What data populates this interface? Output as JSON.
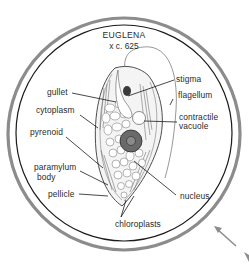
{
  "figure": {
    "title": "EUGLENA",
    "magnification": "x c. 625",
    "colors": {
      "outer_ring": "#8c8c8c",
      "inner_ring": "#1a1a1a",
      "ink": "#2a2a2a",
      "arrow": "#8c8c8c"
    },
    "labels": {
      "gullet": "gullet",
      "cytoplasm": "cytoplasm",
      "pyrenoid": "pyrenoid",
      "paramylum_body_line1": "paramylum",
      "paramylum_body_line2": "body",
      "pellicle": "pellicle",
      "stigma": "stigma",
      "flagellum": "flagellum",
      "contractile_vacuole_line1": "contractile",
      "contractile_vacuole_line2": "vacuole",
      "nucleus": "nucleus",
      "chloroplasts": "chloroplasts"
    }
  }
}
